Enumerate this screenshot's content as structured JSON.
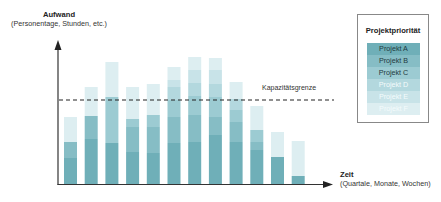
{
  "y_axis": {
    "title": "Aufwand",
    "subtitle": "(Personentage, Stunden, etc.)"
  },
  "x_axis": {
    "title": "Zeit",
    "subtitle": "(Quartale, Monate, Wochen)"
  },
  "capacity": {
    "label": "Kapazitätsgrenze",
    "value": 84
  },
  "legend": {
    "title": "Projektpriorität",
    "items": [
      {
        "label": "Projekt A",
        "color": "#6fafb8",
        "text_color": "#1f3a40"
      },
      {
        "label": "Projekt B",
        "color": "#86bdc5",
        "text_color": "#1f3a40"
      },
      {
        "label": "Projekt C",
        "color": "#9ccbd2",
        "text_color": "#1f3a40"
      },
      {
        "label": "Projekt D",
        "color": "#b3d8de",
        "text_color": "#f4fbfc"
      },
      {
        "label": "Projekt E",
        "color": "#c8e3e8",
        "text_color": "#f4fbfc"
      },
      {
        "label": "Projekt F",
        "color": "#ddeef1",
        "text_color": "#f4fbfc"
      }
    ]
  },
  "chart_data": {
    "type": "bar",
    "stacked": true,
    "title": "",
    "xlabel": "Zeit (Quartale, Monate, Wochen)",
    "ylabel": "Aufwand (Personentage, Stunden, etc.)",
    "categories": [
      "1",
      "2",
      "3",
      "4",
      "5",
      "6",
      "7",
      "8",
      "9",
      "10",
      "11",
      "12"
    ],
    "series": [
      {
        "name": "Projekt A",
        "values": [
          26,
          45,
          41,
          32,
          31,
          41,
          42,
          49,
          42,
          34,
          27,
          8
        ]
      },
      {
        "name": "Projekt B",
        "values": [
          16,
          23,
          0,
          25,
          26,
          26,
          27,
          18,
          20,
          8,
          0,
          0
        ]
      },
      {
        "name": "Projekt C",
        "values": [
          0,
          0,
          46,
          8,
          12,
          17,
          19,
          20,
          12,
          12,
          0,
          0
        ]
      },
      {
        "name": "Projekt D",
        "values": [
          0,
          0,
          0,
          0,
          0,
          13,
          13,
          13,
          11,
          0,
          0,
          0
        ]
      },
      {
        "name": "Projekt E",
        "values": [
          0,
          0,
          0,
          0,
          0,
          7,
          13,
          14,
          0,
          0,
          0,
          0
        ]
      },
      {
        "name": "Projekt F",
        "values": [
          25,
          29,
          35,
          32,
          31,
          13,
          13,
          12,
          17,
          24,
          25,
          35
        ]
      }
    ],
    "capacity_line": 84,
    "capacity_label": "Kapazitätsgrenze",
    "ylim": [
      0,
      140
    ],
    "grid": false,
    "legend_position": "right",
    "legend_title": "Projektpriorität"
  }
}
